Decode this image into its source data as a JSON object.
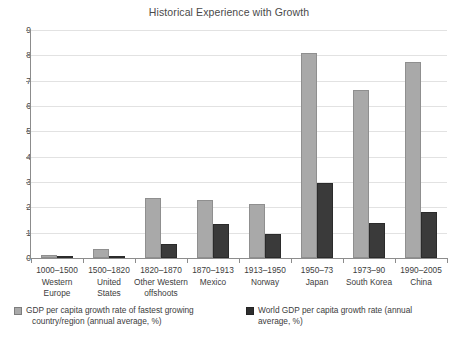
{
  "chart_data": {
    "type": "bar",
    "title": "Historical Experience with Growth",
    "xlabel": "",
    "ylabel": "",
    "ylim": [
      0,
      9
    ],
    "ytick_labels": [
      "0",
      "1",
      "2",
      "3",
      "4",
      "5",
      "6",
      "7",
      "8",
      "9"
    ],
    "yticks": [
      0,
      1,
      2,
      3,
      4,
      5,
      6,
      7,
      8,
      9
    ],
    "grid": true,
    "legend_position": "bottom",
    "categories": [
      "1000–1500 Western Europe",
      "1500–1820 United States",
      "1820–1870 Other Western offshoots",
      "1870–1913 Mexico",
      "1913–1950 Norway",
      "1950–73 Japan",
      "1973–90 South Korea",
      "1990–2005 China"
    ],
    "category_parts": [
      {
        "period": "1000–1500",
        "place": "Western",
        "place2": "Europe"
      },
      {
        "period": "1500–1820",
        "place": "United",
        "place2": "States"
      },
      {
        "period": "1820–1870",
        "place": "Other Western",
        "place2": "offshoots"
      },
      {
        "period": "1870–1913",
        "place": "Mexico",
        "place2": ""
      },
      {
        "period": "1913–1950",
        "place": "Norway",
        "place2": ""
      },
      {
        "period": "1950–73",
        "place": "Japan",
        "place2": ""
      },
      {
        "period": "1973–90",
        "place": "South Korea",
        "place2": ""
      },
      {
        "period": "1990–2005",
        "place": "China",
        "place2": ""
      }
    ],
    "series": [
      {
        "name": "GDP per capita growth rate of fastest growing country/region (annual average, %)",
        "name_line1": "GDP per capita growth rate of fastest growing",
        "name_line2": "country/region (annual average, %)",
        "color": "#a9a9a9",
        "values": [
          0.13,
          0.35,
          2.35,
          2.3,
          2.15,
          8.1,
          6.65,
          7.75
        ]
      },
      {
        "name": "World GDP per capita growth rate (annual average, %)",
        "name_line1": "World GDP per capita growth rate (annual",
        "name_line2": "average, %)",
        "color": "#3a3a3a",
        "values": [
          0.05,
          0.06,
          0.55,
          1.35,
          0.95,
          2.95,
          1.4,
          1.8
        ]
      }
    ]
  }
}
